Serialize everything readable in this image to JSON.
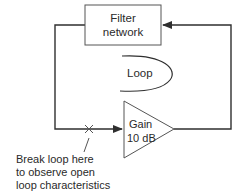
{
  "diagram": {
    "filter_block": {
      "line1": "Filter",
      "line2": "network"
    },
    "loop_label": "Loop",
    "gain_block": {
      "line1": "Gain",
      "line2": "10 dB"
    },
    "annotation": {
      "line1": "Break loop here",
      "line2": "to observe open",
      "line3": "loop characteristics"
    },
    "colors": {
      "stroke": "#2f2f2f",
      "text": "#2a2a2a"
    }
  }
}
